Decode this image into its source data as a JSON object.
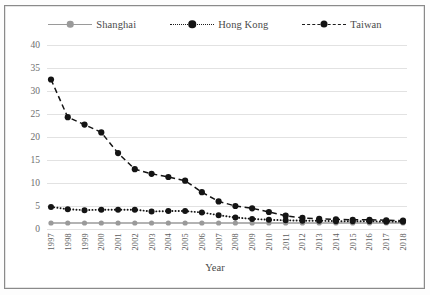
{
  "figure": {
    "background_color": "#ffffff",
    "border_color": "#8a8a8a"
  },
  "legend": {
    "position": "top-center",
    "items": [
      {
        "label": "Shanghai",
        "style": "solid",
        "color": "#9a9a9a",
        "marker": "circle"
      },
      {
        "label": "Hong Kong",
        "style": "dotted",
        "color": "#141414",
        "marker": "circle"
      },
      {
        "label": "Taiwan",
        "style": "dashed",
        "color": "#141414",
        "marker": "circle"
      }
    ]
  },
  "axes": {
    "xlabel": "Year",
    "ylabel": "",
    "yticks": [
      "0",
      "5",
      "10",
      "15",
      "20",
      "25",
      "30",
      "35",
      "40"
    ],
    "ylim": [
      0,
      40
    ],
    "grid": "horizontal-only",
    "grid_color": "#e2e2e2"
  },
  "chart_data": {
    "type": "line",
    "title": "",
    "xlabel": "Year",
    "ylabel": "",
    "ylim": [
      0,
      40
    ],
    "yticks": [
      0,
      5,
      10,
      15,
      20,
      25,
      30,
      35,
      40
    ],
    "grid": true,
    "legend_position": "top-center",
    "x": [
      1997,
      1998,
      1999,
      2000,
      2001,
      2002,
      2003,
      2004,
      2005,
      2006,
      2007,
      2008,
      2009,
      2010,
      2011,
      2012,
      2013,
      2014,
      2015,
      2016,
      2017,
      2018
    ],
    "categories": [
      "1997",
      "1998",
      "1999",
      "2000",
      "2001",
      "2002",
      "2003",
      "2004",
      "2005",
      "2006",
      "2007",
      "2008",
      "2009",
      "2010",
      "2011",
      "2012",
      "2013",
      "2014",
      "2015",
      "2016",
      "2017",
      "2018"
    ],
    "series": [
      {
        "name": "Shanghai",
        "color": "#9a9a9a",
        "style": "solid",
        "marker": "circle",
        "values": [
          1.3,
          1.3,
          1.3,
          1.3,
          1.3,
          1.3,
          1.3,
          1.3,
          1.3,
          1.3,
          1.3,
          1.3,
          1.3,
          1.3,
          1.3,
          1.3,
          1.3,
          1.3,
          1.3,
          1.3,
          1.3,
          1.3
        ]
      },
      {
        "name": "Hong Kong",
        "color": "#141414",
        "style": "dotted",
        "marker": "circle",
        "values": [
          4.8,
          4.3,
          4.1,
          4.2,
          4.2,
          4.2,
          3.8,
          3.9,
          3.9,
          3.6,
          3.0,
          2.5,
          2.2,
          2.0,
          1.9,
          1.8,
          1.8,
          1.7,
          1.7,
          1.7,
          1.6,
          1.6
        ]
      },
      {
        "name": "Taiwan",
        "color": "#141414",
        "style": "dashed",
        "marker": "circle",
        "values": [
          32.5,
          24.3,
          22.7,
          21.0,
          16.5,
          13.0,
          12.0,
          11.3,
          10.5,
          8.0,
          6.0,
          5.0,
          4.5,
          3.7,
          2.9,
          2.4,
          2.2,
          2.1,
          2.0,
          2.0,
          1.9,
          1.8
        ]
      }
    ]
  }
}
